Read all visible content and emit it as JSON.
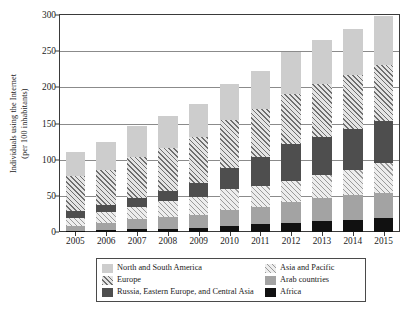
{
  "chart_data": {
    "type": "bar",
    "subtype": "stacked-bar",
    "title": "",
    "xlabel": "",
    "ylabel": "Individuals using the Internet (per 100 inhabitants)",
    "ylabel_line1": "Individuals using the Internet",
    "ylabel_line2": "(per 100 inhabitants)",
    "categories": [
      "2005",
      "2006",
      "2007",
      "2008",
      "2009",
      "2010",
      "2011",
      "2012",
      "2013",
      "2014",
      "2015"
    ],
    "ylim": [
      0,
      300
    ],
    "yticks": [
      0,
      50,
      100,
      150,
      200,
      250,
      300
    ],
    "ytick_labels": [
      "0",
      "50",
      "100",
      "150",
      "200",
      "250",
      "300"
    ],
    "grid": true,
    "grid_axis": "y",
    "legend_position": "bottom",
    "stack_order_bottom_to_top": [
      "Africa",
      "Arab countries",
      "Asia and Pacific",
      "Russia, Eastern Europe, and Central Asia",
      "Europe",
      "North and South America"
    ],
    "series": [
      {
        "name": "Africa",
        "color": "#111111",
        "pattern": "solid",
        "values": [
          2,
          3,
          4,
          4,
          6,
          8,
          11,
          13,
          15,
          17,
          19
        ]
      },
      {
        "name": "Arab countries",
        "color": "#a3a3a3",
        "pattern": "solid",
        "values": [
          6,
          9,
          14,
          17,
          17,
          22,
          24,
          28,
          32,
          34,
          35
        ]
      },
      {
        "name": "Asia and Pacific",
        "color": "#ededed",
        "pattern": "diagonal-hatch-light",
        "values": [
          11,
          15,
          17,
          22,
          25,
          30,
          28,
          30,
          32,
          35,
          41
        ]
      },
      {
        "name": "Russia, Eastern Europe, and Central Asia",
        "color": "#4e4e4e",
        "pattern": "solid",
        "values": [
          10,
          10,
          12,
          14,
          20,
          29,
          40,
          50,
          53,
          57,
          58
        ]
      },
      {
        "name": "Europe",
        "color": "#e4e4e4",
        "pattern": "diagonal-hatch-dark",
        "values": [
          48,
          49,
          57,
          59,
          63,
          66,
          67,
          70,
          73,
          74,
          78
        ]
      },
      {
        "name": "North and South America",
        "color": "#cdcdcd",
        "pattern": "solid",
        "values": [
          34,
          39,
          42,
          45,
          46,
          50,
          52,
          58,
          60,
          64,
          67
        ]
      }
    ],
    "totals": [
      111,
      125,
      146,
      161,
      177,
      205,
      222,
      249,
      265,
      281,
      298
    ]
  },
  "legend": {
    "entries": [
      {
        "label": "North and South America",
        "swatch": "swatch-americas",
        "column": "left"
      },
      {
        "label": "Asia and Pacific",
        "swatch": "swatch-asia",
        "column": "right"
      },
      {
        "label": "Europe",
        "swatch": "swatch-europe",
        "column": "left"
      },
      {
        "label": "Arab countries",
        "swatch": "swatch-arab",
        "column": "right"
      },
      {
        "label": "Russia, Eastern Europe, and Central Asia",
        "swatch": "swatch-russia",
        "column": "left"
      },
      {
        "label": "Africa",
        "swatch": "swatch-africa",
        "column": "right"
      }
    ]
  },
  "colors": {
    "americas": "#cdcdcd",
    "europe": "#e4e4e4",
    "russia": "#4e4e4e",
    "asia": "#ededed",
    "arab": "#a3a3a3",
    "africa": "#111111",
    "axis": "#3a3a3a",
    "grid": "#8b8b8b",
    "background": "#ffffff"
  }
}
